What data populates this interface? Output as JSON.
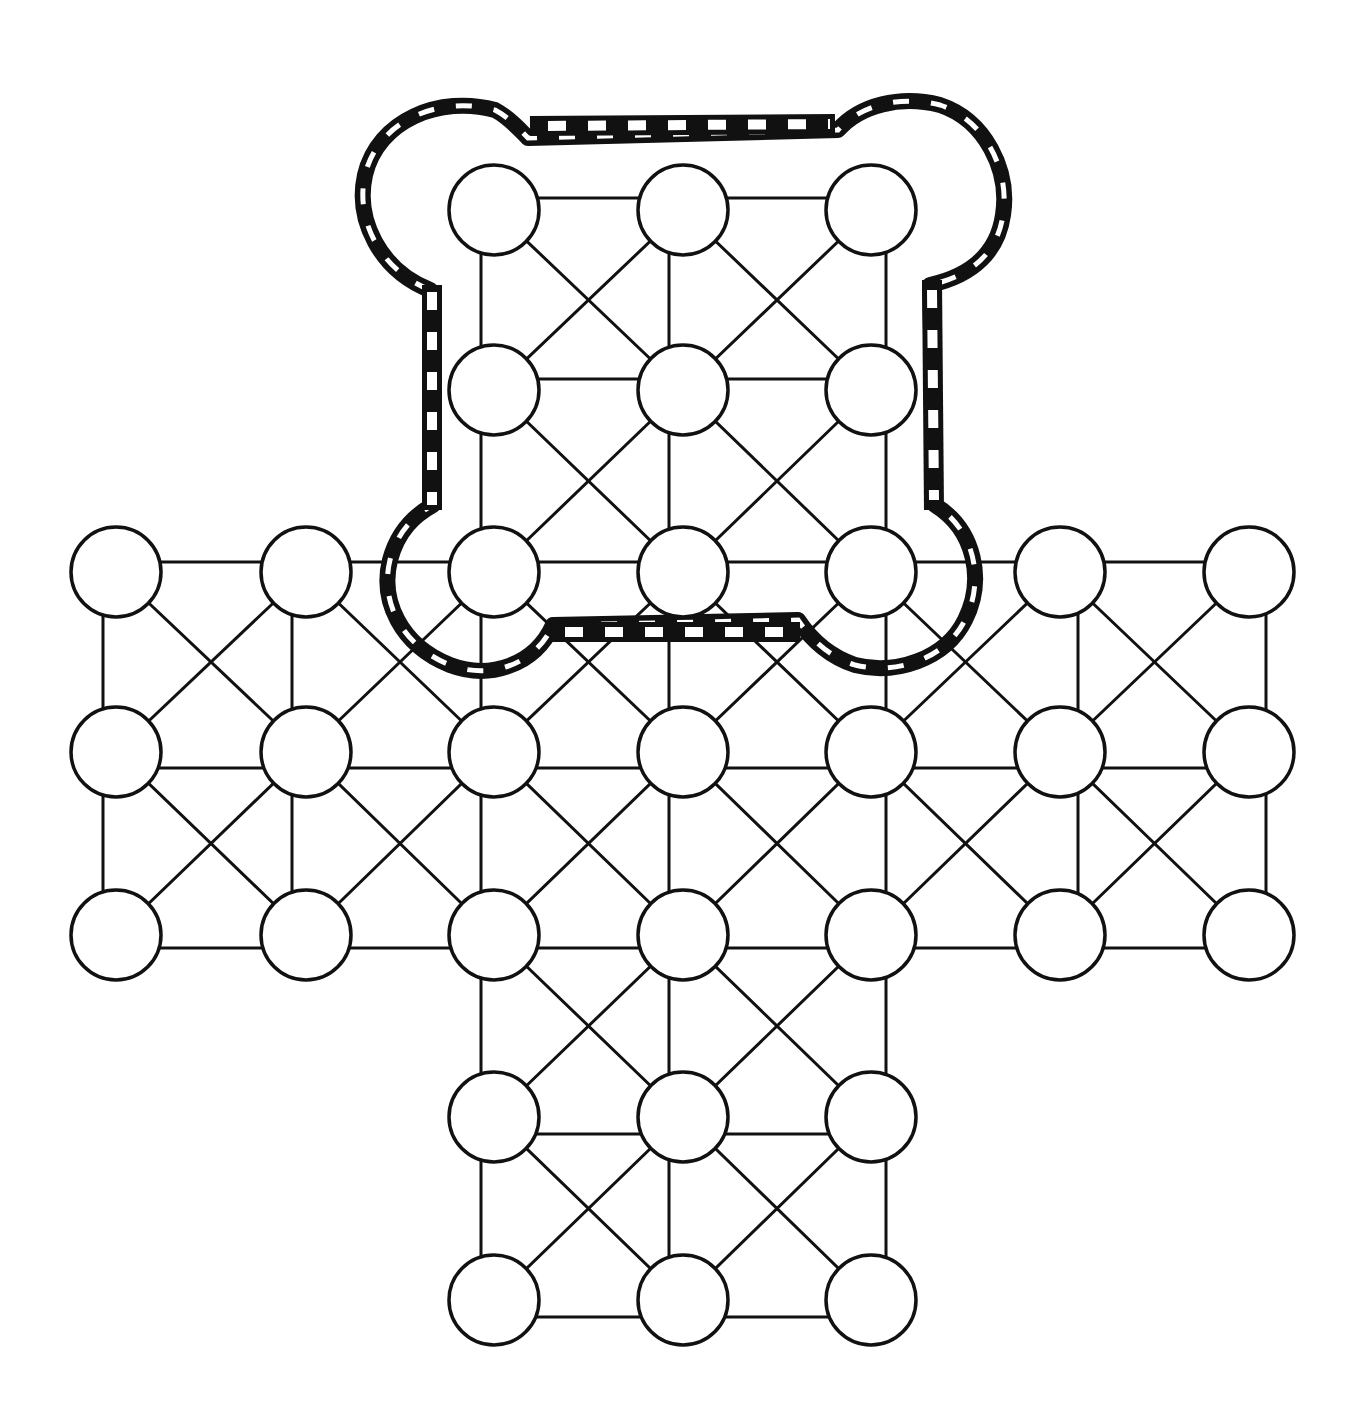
{
  "board": {
    "title": "",
    "kind": "cross-shaped board with fortress",
    "colors": {
      "line": "#111111",
      "node_fill": "#ffffff",
      "background": "#ffffff"
    },
    "node_radius": 45,
    "columns_x": [
      116,
      306,
      494,
      683,
      871,
      1060,
      1249
    ],
    "rows_y": [
      210,
      390,
      572,
      752,
      935,
      1117,
      1300
    ],
    "line_columns_x": [
      103,
      292,
      481,
      669,
      886,
      1078,
      1266
    ],
    "line_rows_y": [
      198,
      379,
      562,
      768,
      948,
      1134,
      1317
    ],
    "nodes": [
      {
        "id": "n1",
        "col": 2,
        "row": 0
      },
      {
        "id": "n2",
        "col": 3,
        "row": 0
      },
      {
        "id": "n3",
        "col": 4,
        "row": 0
      },
      {
        "id": "n4",
        "col": 2,
        "row": 1
      },
      {
        "id": "n5",
        "col": 3,
        "row": 1
      },
      {
        "id": "n6",
        "col": 4,
        "row": 1
      },
      {
        "id": "n7",
        "col": 0,
        "row": 2
      },
      {
        "id": "n8",
        "col": 1,
        "row": 2
      },
      {
        "id": "n9",
        "col": 2,
        "row": 2
      },
      {
        "id": "n10",
        "col": 3,
        "row": 2
      },
      {
        "id": "n11",
        "col": 4,
        "row": 2
      },
      {
        "id": "n12",
        "col": 5,
        "row": 2
      },
      {
        "id": "n13",
        "col": 6,
        "row": 2
      },
      {
        "id": "n14",
        "col": 0,
        "row": 3
      },
      {
        "id": "n15",
        "col": 1,
        "row": 3
      },
      {
        "id": "n16",
        "col": 2,
        "row": 3
      },
      {
        "id": "n17",
        "col": 3,
        "row": 3
      },
      {
        "id": "n18",
        "col": 4,
        "row": 3
      },
      {
        "id": "n19",
        "col": 5,
        "row": 3
      },
      {
        "id": "n20",
        "col": 6,
        "row": 3
      },
      {
        "id": "n21",
        "col": 0,
        "row": 4
      },
      {
        "id": "n22",
        "col": 1,
        "row": 4
      },
      {
        "id": "n23",
        "col": 2,
        "row": 4
      },
      {
        "id": "n24",
        "col": 3,
        "row": 4
      },
      {
        "id": "n25",
        "col": 4,
        "row": 4
      },
      {
        "id": "n26",
        "col": 5,
        "row": 4
      },
      {
        "id": "n27",
        "col": 6,
        "row": 4
      },
      {
        "id": "n28",
        "col": 2,
        "row": 5
      },
      {
        "id": "n29",
        "col": 3,
        "row": 5
      },
      {
        "id": "n30",
        "col": 4,
        "row": 5
      },
      {
        "id": "n31",
        "col": 2,
        "row": 6
      },
      {
        "id": "n32",
        "col": 3,
        "row": 6
      },
      {
        "id": "n33",
        "col": 4,
        "row": 6
      }
    ],
    "fortress": {
      "label": "fortress",
      "covers_rows": [
        0,
        1,
        2
      ],
      "covers_cols": [
        2,
        3,
        4
      ],
      "style": "thick black border with white dashes"
    }
  }
}
